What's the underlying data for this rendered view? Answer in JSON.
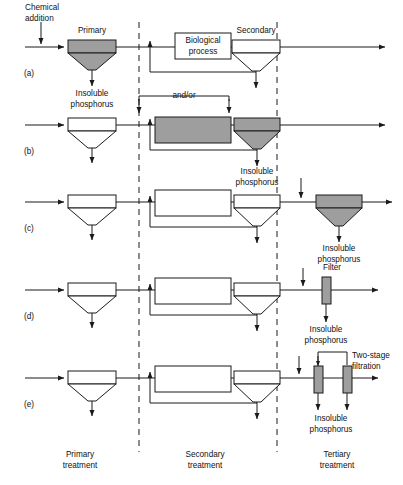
{
  "figure": {
    "rows": [
      {
        "id": "a",
        "letter": "(a)",
        "labels": {
          "chemical_addition": "Chemical\naddition",
          "chemical_addition_line1": "Chemical",
          "chemical_addition_line2": "addition",
          "primary": "Primary",
          "secondary": "Secondary",
          "biological_line1": "Biological",
          "biological_line2": "process",
          "insoluble_line1": "Insoluble",
          "insoluble_line2": "phosphorus"
        },
        "shaded": [
          "primary-clarifier"
        ]
      },
      {
        "id": "b",
        "letter": "(b)",
        "labels": {
          "and_or": "and/or",
          "insoluble_line1": "Insoluble",
          "insoluble_line2": "phosphorus"
        },
        "shaded": [
          "biological-reactor",
          "secondary-clarifier"
        ]
      },
      {
        "id": "c",
        "letter": "(c)",
        "labels": {
          "insoluble_line1": "Insoluble",
          "insoluble_line2": "phosphorus"
        },
        "shaded": [
          "tertiary-clarifier"
        ]
      },
      {
        "id": "d",
        "letter": "(d)",
        "labels": {
          "filter": "Filter",
          "insoluble_line1": "Insoluble",
          "insoluble_line2": "phosphorus"
        },
        "shaded": [
          "tertiary-filter"
        ]
      },
      {
        "id": "e",
        "letter": "(e)",
        "labels": {
          "two_stage_line1": "Two-stage",
          "two_stage_line2": "filtration",
          "insoluble_line1": "Insoluble",
          "insoluble_line2": "phosphorus"
        },
        "shaded": [
          "filter-stage-1",
          "filter-stage-2"
        ]
      }
    ],
    "zones": [
      {
        "id": "primary",
        "line1": "Primary",
        "line2": "treatment"
      },
      {
        "id": "secondary",
        "line1": "Secondary",
        "line2": "treatment"
      },
      {
        "id": "tertiary",
        "line1": "Tertiary",
        "line2": "treatment"
      }
    ],
    "colors": {
      "shade_fill": "#9e9e9e",
      "line": "#1a1a1a",
      "white_fill": "#ffffff",
      "text": "#111111",
      "divider": "#1a1a1a"
    }
  }
}
